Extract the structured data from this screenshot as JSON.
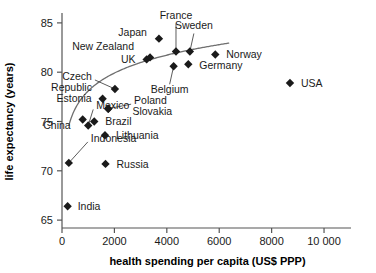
{
  "chart_data": {
    "type": "scatter",
    "title": "",
    "xlabel": "health spending per capita (US$ PPP)",
    "ylabel": "life expectancy (years)",
    "xlim": [
      0,
      10800
    ],
    "ylim": [
      64.2,
      85.8
    ],
    "xticks": [
      0,
      2000,
      4000,
      6000,
      8000,
      10000
    ],
    "xtick_labels": [
      "0",
      "2000",
      "4000",
      "6000",
      "8000",
      "10 000"
    ],
    "yticks": [
      65,
      70,
      75,
      80,
      85
    ],
    "ytick_labels": [
      "65",
      "70",
      "75",
      "80",
      "85"
    ],
    "grid": false,
    "legend": "none",
    "marker_shape": "diamond",
    "marker_color": "#1a1a1a",
    "trend_line": {
      "present": true,
      "color": "#6f6f6f",
      "description": "logarithmic fit curve rising from lower-left to upper-right"
    },
    "points": [
      {
        "name": "India",
        "x": 215,
        "y": 66.4,
        "label_dx": 10,
        "label_dy": 3.6,
        "anchor": "start",
        "leader": false
      },
      {
        "name": "Indonesia",
        "x": 260,
        "y": 70.8,
        "label_dx": 22,
        "label_dy": -21,
        "anchor": "start",
        "leader": true
      },
      {
        "name": "China",
        "x": 790,
        "y": 75.2,
        "label_dx": -12,
        "label_dy": 9.5,
        "anchor": "end",
        "leader": false
      },
      {
        "name": "Mexico",
        "x": 1000,
        "y": 74.6,
        "label_dx": 8,
        "label_dy": -16,
        "anchor": "start",
        "leader": true
      },
      {
        "name": "Brazil",
        "x": 1230,
        "y": 75.0,
        "label_dx": 11,
        "label_dy": 3.6,
        "anchor": "start",
        "leader": false
      },
      {
        "name": "Estonia",
        "x": 1550,
        "y": 77.3,
        "label_dx": -11,
        "label_dy": 3.6,
        "anchor": "end",
        "leader": false
      },
      {
        "name": "Lithuania",
        "x": 1640,
        "y": 73.6,
        "label_dx": 11,
        "label_dy": 3.6,
        "anchor": "start",
        "leader": false
      },
      {
        "name": "Russia",
        "x": 1660,
        "y": 70.7,
        "label_dx": 11,
        "label_dy": 3.6,
        "anchor": "start",
        "leader": false
      },
      {
        "name": "Czech Republic",
        "x": 2020,
        "y": 78.3,
        "label_dx": -23,
        "label_dy": -9,
        "anchor": "end",
        "leader": true
      },
      {
        "name": "Poland",
        "x": 1760,
        "y": 76.3,
        "label_dx": 26,
        "label_dy": -4.5,
        "anchor": "start",
        "leader": true
      },
      {
        "name": "Slovakia",
        "x": 1770,
        "y": 76.3,
        "label_dx": 24,
        "label_dy": 6.5,
        "anchor": "start",
        "leader": false
      },
      {
        "name": "UK",
        "x": 3230,
        "y": 81.3,
        "label_dx": -11,
        "label_dy": 3.6,
        "anchor": "end",
        "leader": false
      },
      {
        "name": "New Zealand",
        "x": 3360,
        "y": 81.5,
        "label_dx": -16,
        "label_dy": -7,
        "anchor": "end",
        "leader": false
      },
      {
        "name": "Japan",
        "x": 3700,
        "y": 83.4,
        "label_dx": -12,
        "label_dy": -3,
        "anchor": "end",
        "leader": false
      },
      {
        "name": "Belgium",
        "x": 4260,
        "y": 80.6,
        "label_dx": -4,
        "label_dy": 27,
        "anchor": "middle",
        "leader": true
      },
      {
        "name": "France",
        "x": 4350,
        "y": 82.1,
        "label_dx": 0,
        "label_dy": -32,
        "anchor": "middle",
        "leader": true
      },
      {
        "name": "Sweden",
        "x": 4880,
        "y": 82.1,
        "label_dx": 4,
        "label_dy": -22,
        "anchor": "middle",
        "leader": true
      },
      {
        "name": "Germany",
        "x": 4820,
        "y": 80.8,
        "label_dx": 11,
        "label_dy": 5,
        "anchor": "start",
        "leader": false
      },
      {
        "name": "Norway",
        "x": 5850,
        "y": 81.8,
        "label_dx": 11,
        "label_dy": 3.6,
        "anchor": "start",
        "leader": false
      },
      {
        "name": "USA",
        "x": 8700,
        "y": 78.9,
        "label_dx": 11,
        "label_dy": 3.6,
        "anchor": "start",
        "leader": false
      }
    ]
  }
}
